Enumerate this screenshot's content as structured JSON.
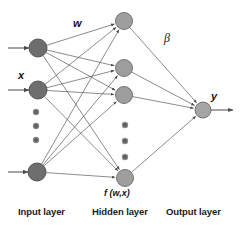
{
  "figure": {
    "type": "neural-network-diagram",
    "background_color": "#ffffff",
    "captions": {
      "input_layer": "Input layer",
      "hidden_layer": "Hidden layer",
      "output_layer": "Output layer"
    },
    "annotations": {
      "weights": "w",
      "beta": "β",
      "input_vector": "x",
      "output_vector": "y",
      "hidden_function": "f (w,x)"
    }
  },
  "chart_data": {
    "type": "diagram",
    "layers": [
      {
        "name": "input",
        "label": "Input layer",
        "node_color": "#6e6e6e",
        "node_stroke": "#4a4a4a",
        "node_radius": 9,
        "nodes": [
          {
            "id": "i1",
            "cx": 38,
            "cy": 48
          },
          {
            "id": "i2",
            "cx": 38,
            "cy": 90
          },
          {
            "id": "i3",
            "cx": 37,
            "cy": 172
          }
        ],
        "ellipsis_dots": [
          {
            "cx": 36,
            "cy": 112
          },
          {
            "cx": 36,
            "cy": 126
          },
          {
            "cx": 36,
            "cy": 140
          }
        ]
      },
      {
        "name": "hidden",
        "label": "Hidden layer",
        "node_color": "#9e9e9e",
        "node_stroke": "#6b6b6b",
        "node_radius": 8.5,
        "nodes": [
          {
            "id": "h1",
            "cx": 124,
            "cy": 21
          },
          {
            "id": "h2",
            "cx": 124,
            "cy": 68
          },
          {
            "id": "h3",
            "cx": 124,
            "cy": 95
          },
          {
            "id": "h4",
            "cx": 125,
            "cy": 178
          }
        ],
        "ellipsis_dots": [
          {
            "cx": 125,
            "cy": 125
          },
          {
            "cx": 125,
            "cy": 141
          },
          {
            "cx": 125,
            "cy": 157
          }
        ]
      },
      {
        "name": "output",
        "label": "Output layer",
        "node_color": "#a5a5a5",
        "node_stroke": "#6b6b6b",
        "node_radius": 8,
        "nodes": [
          {
            "id": "o1",
            "cx": 203,
            "cy": 110
          }
        ],
        "ellipsis_dots": []
      }
    ],
    "input_arrows": [
      {
        "x1": 8,
        "y1": 48,
        "x2": 29,
        "y2": 48
      },
      {
        "x1": 8,
        "y1": 90,
        "x2": 29,
        "y2": 90
      },
      {
        "x1": 8,
        "y1": 172,
        "x2": 28,
        "y2": 172
      }
    ],
    "output_arrows": [
      {
        "x1": 211,
        "y1": 110,
        "x2": 233,
        "y2": 110
      }
    ],
    "edges_input_to_hidden": [
      {
        "from": "i1",
        "to": "h1"
      },
      {
        "from": "i1",
        "to": "h2"
      },
      {
        "from": "i1",
        "to": "h3"
      },
      {
        "from": "i1",
        "to": "h4"
      },
      {
        "from": "i2",
        "to": "h1"
      },
      {
        "from": "i2",
        "to": "h2"
      },
      {
        "from": "i2",
        "to": "h3"
      },
      {
        "from": "i2",
        "to": "h4"
      },
      {
        "from": "i3",
        "to": "h1"
      },
      {
        "from": "i3",
        "to": "h2"
      },
      {
        "from": "i3",
        "to": "h3"
      },
      {
        "from": "i3",
        "to": "h4"
      }
    ],
    "edges_hidden_to_output": [
      {
        "from": "h1",
        "to": "o1"
      },
      {
        "from": "h2",
        "to": "o1"
      },
      {
        "from": "h3",
        "to": "o1"
      },
      {
        "from": "h4",
        "to": "o1"
      }
    ],
    "edge_color": "#5a5a5a",
    "edge_width": 0.7,
    "legend": [],
    "grid": false
  }
}
